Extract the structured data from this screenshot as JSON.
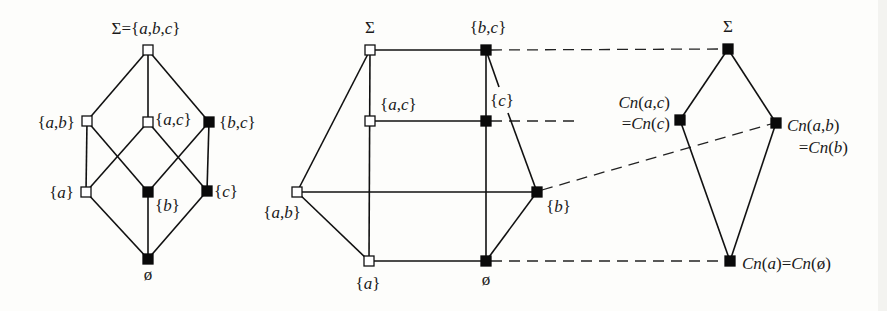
{
  "figure": {
    "background": "#fdfdfb",
    "ink_color": "#111111",
    "node_size": 10
  },
  "diagrams": [
    {
      "id": "powerset-lattice",
      "nodes": [
        {
          "id": "top",
          "x": 148,
          "y": 50,
          "style": "open",
          "label": "Σ={a,b,c}",
          "lx": 146,
          "ly": 34,
          "anchor": "middle"
        },
        {
          "id": "ab",
          "x": 87,
          "y": 121,
          "style": "open",
          "label": "{a,b}",
          "lx": 75,
          "ly": 128,
          "anchor": "end"
        },
        {
          "id": "ac",
          "x": 148,
          "y": 122,
          "style": "open",
          "label": "{a,c}",
          "lx": 155,
          "ly": 125,
          "anchor": "start"
        },
        {
          "id": "bc",
          "x": 209,
          "y": 122,
          "style": "filled",
          "label": "{b,c}",
          "lx": 219,
          "ly": 128,
          "anchor": "start"
        },
        {
          "id": "a",
          "x": 86,
          "y": 192,
          "style": "open",
          "label": "{a}",
          "lx": 74,
          "ly": 198,
          "anchor": "end"
        },
        {
          "id": "b",
          "x": 148,
          "y": 192,
          "style": "filled",
          "label": "{b}",
          "lx": 155,
          "ly": 211,
          "anchor": "start"
        },
        {
          "id": "c",
          "x": 207,
          "y": 191,
          "style": "filled",
          "label": "{c}",
          "lx": 214,
          "ly": 197,
          "anchor": "start"
        },
        {
          "id": "bot",
          "x": 148,
          "y": 259,
          "style": "filled",
          "label": "ø",
          "lx": 148,
          "ly": 280,
          "anchor": "middle"
        }
      ],
      "edges": [
        [
          "top",
          "ab"
        ],
        [
          "top",
          "ac"
        ],
        [
          "top",
          "bc"
        ],
        [
          "ab",
          "a"
        ],
        [
          "ab",
          "b"
        ],
        [
          "ac",
          "a"
        ],
        [
          "ac",
          "c"
        ],
        [
          "bc",
          "b"
        ],
        [
          "bc",
          "c"
        ],
        [
          "a",
          "bot"
        ],
        [
          "b",
          "bot"
        ],
        [
          "c",
          "bot"
        ]
      ],
      "free_labels": []
    },
    {
      "id": "redrawn-lattice",
      "nodes": [
        {
          "id": "sigma",
          "x": 370,
          "y": 50,
          "style": "open",
          "label": "Σ",
          "lx": 370,
          "ly": 33,
          "anchor": "middle"
        },
        {
          "id": "bc",
          "x": 486,
          "y": 50,
          "style": "filled",
          "label": "{b,c}",
          "lx": 488,
          "ly": 33,
          "anchor": "middle"
        },
        {
          "id": "ac",
          "x": 370,
          "y": 121,
          "style": "open",
          "label": "{a,c}",
          "lx": 380,
          "ly": 110,
          "anchor": "start"
        },
        {
          "id": "c",
          "x": 486,
          "y": 121,
          "style": "filled",
          "label": "",
          "lx": 0,
          "ly": 0,
          "anchor": "start"
        },
        {
          "id": "ab",
          "x": 297,
          "y": 192,
          "style": "open",
          "label": "{a,b}",
          "lx": 282,
          "ly": 218,
          "anchor": "middle"
        },
        {
          "id": "b",
          "x": 537,
          "y": 192,
          "style": "filled",
          "label": "{b}",
          "lx": 546,
          "ly": 212,
          "anchor": "start"
        },
        {
          "id": "a",
          "x": 369,
          "y": 261,
          "style": "open",
          "label": "{a}",
          "lx": 368,
          "ly": 289,
          "anchor": "middle"
        },
        {
          "id": "empty",
          "x": 486,
          "y": 261,
          "style": "filled",
          "label": "ø",
          "lx": 486,
          "ly": 285,
          "anchor": "middle"
        }
      ],
      "edges": [
        [
          "sigma",
          "bc"
        ],
        [
          "sigma",
          "ab"
        ],
        [
          "sigma",
          "a"
        ],
        [
          "ac",
          "c"
        ],
        [
          "bc",
          "empty"
        ],
        [
          "ab",
          "b"
        ],
        [
          "ab",
          "a"
        ],
        [
          "a",
          "empty"
        ],
        [
          "b",
          "empty"
        ]
      ],
      "polyline_edges": [
        {
          "from": "bc",
          "to": "b",
          "points": [
            [
              486,
              50
            ],
            [
              499,
              87
            ]
          ],
          "points2": [
            [
              508,
              113
            ],
            [
              537,
              192
            ]
          ]
        }
      ],
      "free_labels": [
        {
          "text": "{c}",
          "x": 502,
          "y": 106,
          "anchor": "middle"
        }
      ]
    },
    {
      "id": "consequence-lattice",
      "nodes": [
        {
          "id": "sigma",
          "x": 728,
          "y": 49,
          "style": "filled",
          "label": "Σ",
          "lx": 728,
          "ly": 32,
          "anchor": "middle"
        },
        {
          "id": "cnac",
          "x": 680,
          "y": 120,
          "style": "filled",
          "label": "",
          "lx": 0,
          "ly": 0,
          "anchor": "end"
        },
        {
          "id": "cnab",
          "x": 776,
          "y": 123,
          "style": "filled",
          "label": "",
          "lx": 0,
          "ly": 0,
          "anchor": "start"
        },
        {
          "id": "cna",
          "x": 730,
          "y": 261,
          "style": "filled",
          "label": "Cn(a)=Cn(ø)",
          "lx": 742,
          "ly": 269,
          "anchor": "start"
        }
      ],
      "edges": [
        [
          "sigma",
          "cnac"
        ],
        [
          "sigma",
          "cnab"
        ],
        [
          "cnac",
          "cna"
        ],
        [
          "cnab",
          "cna"
        ]
      ],
      "free_labels": [
        {
          "text": "Cn(a,c)",
          "x": 670,
          "y": 108,
          "anchor": "end"
        },
        {
          "text": "=Cn(c)",
          "x": 670,
          "y": 129,
          "anchor": "end"
        },
        {
          "text": "Cn(a,b)",
          "x": 787,
          "y": 131,
          "anchor": "start"
        },
        {
          "text": "=Cn(b)",
          "x": 848,
          "y": 153,
          "anchor": "end"
        }
      ]
    }
  ],
  "mappings": [
    {
      "from": "{b,c}",
      "to": "Σ",
      "x1": 491,
      "y1": 50,
      "x2": 722,
      "y2": 49
    },
    {
      "from": "{c}",
      "to": "Cn(a,c) (partial)",
      "x1": 491,
      "y1": 121,
      "x2": 580,
      "y2": 121
    },
    {
      "from": "{b}",
      "to": "Cn(a,b)",
      "x1": 542,
      "y1": 190,
      "x2": 771,
      "y2": 124
    },
    {
      "from": "ø",
      "to": "Cn(a)",
      "x1": 491,
      "y1": 261,
      "x2": 724,
      "y2": 261
    }
  ]
}
